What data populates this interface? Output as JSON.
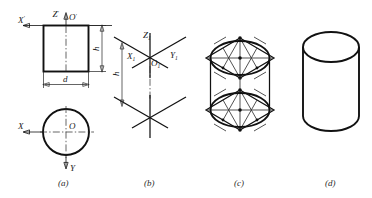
{
  "figure": {
    "background_color": "#ffffff",
    "line_color": "#111111",
    "construction_color": "#333333",
    "panels": [
      {
        "id": "a",
        "caption": "(a)",
        "description": "Two orthographic views: front view rectangle and top view circle with projection axes",
        "labels": [
          {
            "name": "x-prime-axis-label",
            "text": "X",
            "prime": "'"
          },
          {
            "name": "z-prime-axis-label",
            "text": "Z",
            "prime": "'"
          },
          {
            "name": "o-prime-origin-label",
            "text": "O",
            "prime": "'"
          },
          {
            "name": "x-axis-label",
            "text": "X",
            "prime": ""
          },
          {
            "name": "y-axis-label",
            "text": "Y",
            "prime": ""
          },
          {
            "name": "o-origin-label",
            "text": "O",
            "prime": ""
          }
        ],
        "dimensions": [
          {
            "name": "height-dimension",
            "symbol": "h",
            "orientation": "vertical"
          },
          {
            "name": "diameter-dimension",
            "symbol": "d",
            "orientation": "horizontal"
          }
        ]
      },
      {
        "id": "b",
        "caption": "(b)",
        "description": "Isometric axes drawn at top and bottom, separated by height h",
        "labels": [
          {
            "name": "z1-axis-label",
            "text": "Z",
            "sub": "1"
          },
          {
            "name": "x1-axis-label",
            "text": "X",
            "sub": "1"
          },
          {
            "name": "y1-axis-label",
            "text": "Y",
            "sub": "1"
          },
          {
            "name": "o1-origin-label",
            "text": "O",
            "sub": "1"
          }
        ],
        "dimensions": [
          {
            "name": "height-dimension",
            "symbol": "h",
            "orientation": "vertical"
          }
        ]
      },
      {
        "id": "c",
        "caption": "(c)",
        "description": "Four-centre ellipse construction inside upper and lower rhombi",
        "labels": [],
        "dimensions": []
      },
      {
        "id": "d",
        "caption": "(d)",
        "description": "Finished isometric view of the cylinder",
        "labels": [],
        "dimensions": []
      }
    ]
  }
}
